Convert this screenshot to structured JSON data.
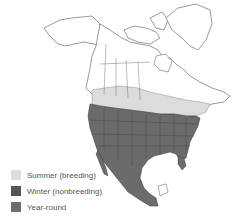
{
  "map": {
    "region": "North America",
    "colors": {
      "summer": "#dcdcdc",
      "winter": "#555555",
      "year_round": "#6b6b6b",
      "land": "#ffffff",
      "border": "#444444"
    }
  },
  "legend": {
    "items": [
      {
        "label": "Summer (breeding)",
        "color": "#dcdcdc"
      },
      {
        "label": "Winter (nonbreeding)",
        "color": "#555555"
      },
      {
        "label": "Year-round",
        "color": "#6b6b6b"
      }
    ]
  }
}
